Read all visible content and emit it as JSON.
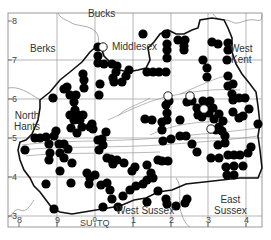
{
  "map": {
    "title": "",
    "frame": {
      "x": 8,
      "y": 13,
      "w": 254,
      "h": 214
    },
    "grid_ref_label": "SU 0 TQ",
    "grid_ref_parts": {
      "left": "SU",
      "mid": "0",
      "right": "TQ"
    },
    "x_ticks": [
      {
        "label": "8",
        "x": 19
      },
      {
        "label": "9",
        "x": 57
      },
      {
        "label": "1",
        "x": 133
      },
      {
        "label": "2",
        "x": 171
      },
      {
        "label": "3",
        "x": 208
      },
      {
        "label": "4",
        "x": 246
      }
    ],
    "y_ticks": [
      {
        "label": "8",
        "y": 21
      },
      {
        "label": "7",
        "y": 60
      },
      {
        "label": "6",
        "y": 99
      },
      {
        "label": "5",
        "y": 138
      },
      {
        "label": "4",
        "y": 177
      },
      {
        "label": "3",
        "y": 216
      }
    ],
    "regions": [
      {
        "name": "Bucks",
        "x": 100,
        "y": 15
      },
      {
        "name": "Berks",
        "x": 44,
        "y": 42
      },
      {
        "name": "Middlesex",
        "x": 121,
        "y": 42
      },
      {
        "name": "West\nKent",
        "x": 240,
        "y": 46
      },
      {
        "name": "North\nHants",
        "x": 24,
        "y": 112
      },
      {
        "name": "West Sussex",
        "x": 148,
        "y": 210
      },
      {
        "name": "East\nSussex",
        "x": 226,
        "y": 202
      }
    ],
    "colors": {
      "filled_dot": "#000000",
      "open_dot": "#ffffff",
      "boundary": "#111111",
      "grid": "#9a9a9a",
      "river": "#888888"
    },
    "legend": {
      "filled": "present",
      "open": "historic / unconfirmed"
    }
  },
  "dots_filled": [
    [
      98,
      47
    ],
    [
      98,
      56
    ],
    [
      98,
      63
    ],
    [
      104,
      64
    ],
    [
      112,
      64
    ],
    [
      117,
      66
    ],
    [
      129,
      70
    ],
    [
      126,
      76
    ],
    [
      122,
      82
    ],
    [
      114,
      82
    ],
    [
      113,
      78
    ],
    [
      116,
      72
    ],
    [
      100,
      84
    ],
    [
      83,
      74
    ],
    [
      84,
      80
    ],
    [
      67,
      87
    ],
    [
      70,
      95
    ],
    [
      64,
      89
    ],
    [
      76,
      95
    ],
    [
      84,
      88
    ],
    [
      99,
      95
    ],
    [
      143,
      34
    ],
    [
      166,
      34
    ],
    [
      167,
      44
    ],
    [
      167,
      50
    ],
    [
      167,
      58
    ],
    [
      178,
      40
    ],
    [
      185,
      40
    ],
    [
      184,
      46
    ],
    [
      184,
      50
    ],
    [
      212,
      42
    ],
    [
      218,
      44
    ],
    [
      203,
      60
    ],
    [
      228,
      76
    ],
    [
      228,
      86
    ],
    [
      227,
      60
    ],
    [
      228,
      50
    ],
    [
      228,
      43
    ],
    [
      147,
      72
    ],
    [
      153,
      72
    ],
    [
      159,
      72
    ],
    [
      166,
      72
    ],
    [
      207,
      68
    ],
    [
      207,
      77
    ],
    [
      233,
      84
    ],
    [
      232,
      94
    ],
    [
      233,
      100
    ],
    [
      239,
      98
    ],
    [
      245,
      98
    ],
    [
      233,
      112
    ],
    [
      239,
      118
    ],
    [
      243,
      116
    ],
    [
      249,
      109
    ],
    [
      258,
      124
    ],
    [
      251,
      147
    ],
    [
      248,
      153
    ],
    [
      169,
      101
    ],
    [
      166,
      105
    ],
    [
      167,
      113
    ],
    [
      167,
      120
    ],
    [
      145,
      119
    ],
    [
      152,
      120
    ],
    [
      162,
      122
    ],
    [
      162,
      130
    ],
    [
      180,
      120
    ],
    [
      187,
      102
    ],
    [
      192,
      101
    ],
    [
      197,
      108
    ],
    [
      203,
      101
    ],
    [
      205,
      108
    ],
    [
      210,
      101
    ],
    [
      213,
      108
    ],
    [
      198,
      115
    ],
    [
      202,
      117
    ],
    [
      209,
      113
    ],
    [
      214,
      119
    ],
    [
      219,
      114
    ],
    [
      223,
      121
    ],
    [
      219,
      127
    ],
    [
      216,
      130
    ],
    [
      222,
      131
    ],
    [
      225,
      136
    ],
    [
      225,
      143
    ],
    [
      218,
      145
    ],
    [
      211,
      158
    ],
    [
      219,
      158
    ],
    [
      228,
      155
    ],
    [
      234,
      155
    ],
    [
      240,
      155
    ],
    [
      243,
      166
    ],
    [
      234,
      166
    ],
    [
      226,
      167
    ],
    [
      234,
      175
    ],
    [
      227,
      175
    ],
    [
      53,
      98
    ],
    [
      74,
      102
    ],
    [
      75,
      110
    ],
    [
      70,
      115
    ],
    [
      78,
      115
    ],
    [
      83,
      115
    ],
    [
      74,
      120
    ],
    [
      80,
      120
    ],
    [
      71,
      128
    ],
    [
      82,
      127
    ],
    [
      77,
      133
    ],
    [
      90,
      127
    ],
    [
      93,
      129
    ],
    [
      92,
      124
    ],
    [
      56,
      131
    ],
    [
      54,
      136
    ],
    [
      46,
      137
    ],
    [
      40,
      138
    ],
    [
      35,
      138
    ],
    [
      25,
      150
    ],
    [
      98,
      140
    ],
    [
      102,
      139
    ],
    [
      106,
      132
    ],
    [
      103,
      145
    ],
    [
      99,
      150
    ],
    [
      107,
      158
    ],
    [
      111,
      159
    ],
    [
      113,
      164
    ],
    [
      117,
      160
    ],
    [
      124,
      163
    ],
    [
      135,
      167
    ],
    [
      132,
      171
    ],
    [
      147,
      180
    ],
    [
      153,
      178
    ],
    [
      158,
      160
    ],
    [
      162,
      161
    ],
    [
      168,
      161
    ],
    [
      151,
      173
    ],
    [
      147,
      165
    ],
    [
      163,
      141
    ],
    [
      171,
      139
    ],
    [
      180,
      136
    ],
    [
      186,
      136
    ],
    [
      192,
      144
    ],
    [
      197,
      152
    ],
    [
      49,
      144
    ],
    [
      50,
      153
    ],
    [
      59,
      144
    ],
    [
      60,
      153
    ],
    [
      49,
      160
    ],
    [
      64,
      144
    ],
    [
      68,
      149
    ],
    [
      64,
      158
    ],
    [
      72,
      163
    ],
    [
      60,
      171
    ],
    [
      87,
      173
    ],
    [
      95,
      175
    ],
    [
      46,
      184
    ],
    [
      71,
      183
    ],
    [
      89,
      184
    ],
    [
      90,
      178
    ],
    [
      101,
      185
    ],
    [
      107,
      183
    ],
    [
      110,
      190
    ],
    [
      130,
      190
    ],
    [
      143,
      184
    ],
    [
      158,
      191
    ],
    [
      166,
      199
    ],
    [
      167,
      204
    ],
    [
      176,
      206
    ],
    [
      185,
      203
    ],
    [
      187,
      199
    ],
    [
      54,
      209
    ],
    [
      103,
      207
    ],
    [
      118,
      207
    ],
    [
      147,
      202
    ],
    [
      112,
      199
    ],
    [
      123,
      196
    ],
    [
      136,
      186
    ]
  ],
  "dots_open": [
    [
      103,
      47
    ],
    [
      168,
      96
    ],
    [
      190,
      96
    ],
    [
      204,
      109
    ],
    [
      211,
      129
    ]
  ]
}
